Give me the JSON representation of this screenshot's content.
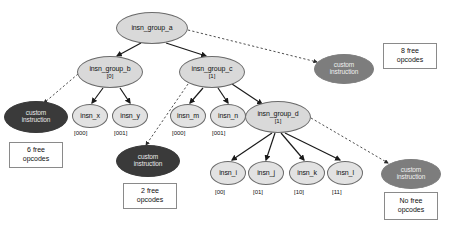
{
  "diagram": {
    "colors": {
      "group_fill": "#d9d9d9",
      "leaf_fill": "#e2e2e2",
      "custom_dark_fill": "#3a3a3a",
      "custom_mid_fill": "#7d7d7d",
      "edge_solid": "#1a1a1a",
      "edge_dashed": "#3a3a3a",
      "box_border": "#8a8a8a",
      "background": "#ffffff"
    },
    "nodes": [
      {
        "id": "insn_group_a",
        "label": "insn_group_a",
        "sub": "",
        "kind": "group",
        "cx": 152,
        "cy": 28,
        "rx": 36,
        "ry": 16
      },
      {
        "id": "insn_group_b",
        "label": "insn_group_b",
        "sub": "[0]",
        "kind": "group",
        "cx": 110,
        "cy": 72,
        "rx": 33,
        "ry": 16
      },
      {
        "id": "insn_group_c",
        "label": "insn_group_c",
        "sub": "[1]",
        "kind": "group",
        "cx": 212,
        "cy": 72,
        "rx": 33,
        "ry": 16
      },
      {
        "id": "insn_group_d",
        "label": "insn_group_d",
        "sub": "[1]",
        "kind": "group",
        "cx": 278,
        "cy": 117,
        "rx": 33,
        "ry": 16
      },
      {
        "id": "insn_x",
        "label": "insn_x",
        "sub": "",
        "kind": "leaf",
        "cx": 90,
        "cy": 116,
        "rx": 18,
        "ry": 12
      },
      {
        "id": "insn_y",
        "label": "insn_y",
        "sub": "",
        "kind": "leaf",
        "cx": 130,
        "cy": 116,
        "rx": 18,
        "ry": 12
      },
      {
        "id": "insn_m",
        "label": "insn_m",
        "sub": "",
        "kind": "leaf",
        "cx": 188,
        "cy": 116,
        "rx": 18,
        "ry": 12
      },
      {
        "id": "insn_n",
        "label": "insn_n",
        "sub": "",
        "kind": "leaf",
        "cx": 228,
        "cy": 116,
        "rx": 18,
        "ry": 12
      },
      {
        "id": "insn_i",
        "label": "insn_i",
        "sub": "",
        "kind": "leaf",
        "cx": 228,
        "cy": 173,
        "rx": 18,
        "ry": 12
      },
      {
        "id": "insn_j",
        "label": "insn_j",
        "sub": "",
        "kind": "leaf",
        "cx": 266,
        "cy": 173,
        "rx": 18,
        "ry": 12
      },
      {
        "id": "insn_k",
        "label": "insn_k",
        "sub": "",
        "kind": "leaf",
        "cx": 307,
        "cy": 173,
        "rx": 18,
        "ry": 12
      },
      {
        "id": "insn_l",
        "label": "insn_l",
        "sub": "",
        "kind": "leaf",
        "cx": 345,
        "cy": 173,
        "rx": 18,
        "ry": 12
      },
      {
        "id": "custom_left",
        "label": "custom instruction",
        "sub": "",
        "kind": "custom-dark",
        "cx": 36,
        "cy": 117,
        "rx": 32,
        "ry": 16
      },
      {
        "id": "custom_mid",
        "label": "custom instruction",
        "sub": "",
        "kind": "custom-dark",
        "cx": 148,
        "cy": 161,
        "rx": 32,
        "ry": 16
      },
      {
        "id": "custom_top",
        "label": "custom instruction",
        "sub": "",
        "kind": "custom-mid",
        "cx": 344,
        "cy": 69,
        "rx": 30,
        "ry": 15
      },
      {
        "id": "custom_right",
        "label": "custom instruction",
        "sub": "",
        "kind": "custom-mid",
        "cx": 411,
        "cy": 174,
        "rx": 30,
        "ry": 15
      }
    ],
    "node_tags": [
      {
        "for": "insn_x",
        "text": "[000]",
        "x": 74,
        "y": 130
      },
      {
        "for": "insn_y",
        "text": "[001]",
        "x": 114,
        "y": 130
      },
      {
        "for": "insn_m",
        "text": "[000]",
        "x": 172,
        "y": 130
      },
      {
        "for": "insn_n",
        "text": "[001]",
        "x": 212,
        "y": 130
      },
      {
        "for": "insn_i",
        "text": "[00]",
        "x": 215,
        "y": 189
      },
      {
        "for": "insn_j",
        "text": "[01]",
        "x": 253,
        "y": 189
      },
      {
        "for": "insn_k",
        "text": "[10]",
        "x": 294,
        "y": 189
      },
      {
        "for": "insn_l",
        "text": "[11]",
        "x": 332,
        "y": 189
      }
    ],
    "opcode_boxes": [
      {
        "id": "box_left",
        "line1": "6 free",
        "line2": "opcodes",
        "x": 9,
        "y": 142,
        "w": 54,
        "h": 26
      },
      {
        "id": "box_mid",
        "line1": "2 free",
        "line2": "opcodes",
        "x": 123,
        "y": 183,
        "w": 54,
        "h": 26
      },
      {
        "id": "box_top",
        "line1": "8 free",
        "line2": "opcodes",
        "x": 383,
        "y": 43,
        "w": 54,
        "h": 26
      },
      {
        "id": "box_right",
        "line1": "No free",
        "line2": "opcodes",
        "x": 384,
        "y": 192,
        "w": 54,
        "h": 28
      }
    ],
    "edges": [
      {
        "from": "insn_group_a",
        "to": "insn_group_b",
        "style": "solid",
        "x1": 141,
        "y1": 43,
        "x2": 117,
        "y2": 56
      },
      {
        "from": "insn_group_a",
        "to": "insn_group_c",
        "style": "solid",
        "x1": 166,
        "y1": 43,
        "x2": 206,
        "y2": 56
      },
      {
        "from": "insn_group_a",
        "to": "custom_top",
        "style": "dashed",
        "x1": 188,
        "y1": 30,
        "x2": 317,
        "y2": 62
      },
      {
        "from": "insn_group_b",
        "to": "insn_x",
        "style": "solid",
        "x1": 103,
        "y1": 88,
        "x2": 92,
        "y2": 103
      },
      {
        "from": "insn_group_b",
        "to": "insn_y",
        "style": "solid",
        "x1": 120,
        "y1": 88,
        "x2": 130,
        "y2": 103
      },
      {
        "from": "insn_group_b",
        "to": "custom_left",
        "style": "dashed",
        "x1": 78,
        "y1": 74,
        "x2": 44,
        "y2": 103
      },
      {
        "from": "insn_group_c",
        "to": "insn_m",
        "style": "solid",
        "x1": 203,
        "y1": 88,
        "x2": 190,
        "y2": 103
      },
      {
        "from": "insn_group_c",
        "to": "insn_n",
        "style": "solid",
        "x1": 218,
        "y1": 88,
        "x2": 228,
        "y2": 103
      },
      {
        "from": "insn_group_c",
        "to": "insn_group_d",
        "style": "solid",
        "x1": 232,
        "y1": 84,
        "x2": 262,
        "y2": 104
      },
      {
        "from": "insn_group_c",
        "to": "custom_mid",
        "style": "dashed",
        "x1": 188,
        "y1": 84,
        "x2": 146,
        "y2": 145
      },
      {
        "from": "insn_group_d",
        "to": "insn_i",
        "style": "solid",
        "x1": 272,
        "y1": 133,
        "x2": 232,
        "y2": 160
      },
      {
        "from": "insn_group_d",
        "to": "insn_j",
        "style": "solid",
        "x1": 275,
        "y1": 133,
        "x2": 266,
        "y2": 160
      },
      {
        "from": "insn_group_d",
        "to": "insn_k",
        "style": "solid",
        "x1": 281,
        "y1": 133,
        "x2": 304,
        "y2": 160
      },
      {
        "from": "insn_group_d",
        "to": "insn_l",
        "style": "solid",
        "x1": 285,
        "y1": 133,
        "x2": 340,
        "y2": 160
      },
      {
        "from": "insn_group_d",
        "to": "custom_right",
        "style": "dashed",
        "x1": 311,
        "y1": 118,
        "x2": 388,
        "y2": 163
      }
    ]
  }
}
